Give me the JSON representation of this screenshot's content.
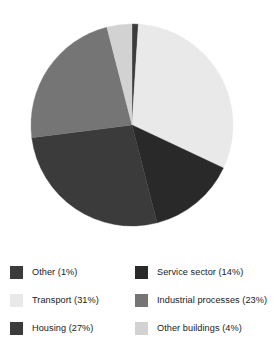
{
  "chart_data": {
    "type": "pie",
    "title": "",
    "subtitle": "",
    "xlabel": "",
    "ylabel": "",
    "legend_position": "bottom",
    "grid": false,
    "start_angle_deg": 0,
    "direction": "clockwise",
    "categories": [
      "Other",
      "Transport",
      "Service sector",
      "Housing",
      "Industrial processes",
      "Other buildings"
    ],
    "values": [
      1,
      31,
      14,
      27,
      23,
      4
    ],
    "units": "%",
    "slices": [
      {
        "label": "Other",
        "value": 1,
        "percent_text": "(1%)",
        "color": "#3b3b3b",
        "start_deg": 0,
        "end_deg": 3.6
      },
      {
        "label": "Transport",
        "value": 31,
        "percent_text": "(31%)",
        "color": "#e9e9e9",
        "start_deg": 3.6,
        "end_deg": 115.2
      },
      {
        "label": "Service sector",
        "value": 14,
        "percent_text": "(14%)",
        "color": "#292929",
        "start_deg": 115.2,
        "end_deg": 165.6
      },
      {
        "label": "Housing",
        "value": 27,
        "percent_text": "(27%)",
        "color": "#3b3b3b",
        "start_deg": 165.6,
        "end_deg": 262.8
      },
      {
        "label": "Industrial processes",
        "value": 23,
        "percent_text": "(23%)",
        "color": "#757575",
        "start_deg": 262.8,
        "end_deg": 345.6
      },
      {
        "label": "Other buildings",
        "value": 4,
        "percent_text": "(4%)",
        "color": "#d2d2d2",
        "start_deg": 345.6,
        "end_deg": 360
      }
    ]
  },
  "legend": {
    "columns": [
      {
        "items": [
          {
            "label": "Other (1%)",
            "color": "#3b3b3b",
            "name": "other"
          },
          {
            "label": "Transport (31%)",
            "color": "#e9e9e9",
            "name": "transport"
          },
          {
            "label": "Housing (27%)",
            "color": "#3b3b3b",
            "name": "housing"
          }
        ]
      },
      {
        "items": [
          {
            "label": "Service sector (14%)",
            "color": "#292929",
            "name": "service-sector"
          },
          {
            "label": "Industrial processes (23%)",
            "color": "#757575",
            "name": "industrial-processes"
          },
          {
            "label": "Other buildings (4%)",
            "color": "#d2d2d2",
            "name": "other-buildings"
          }
        ]
      }
    ]
  },
  "geometry": {
    "cx": 132,
    "cy": 125,
    "r": 101
  }
}
